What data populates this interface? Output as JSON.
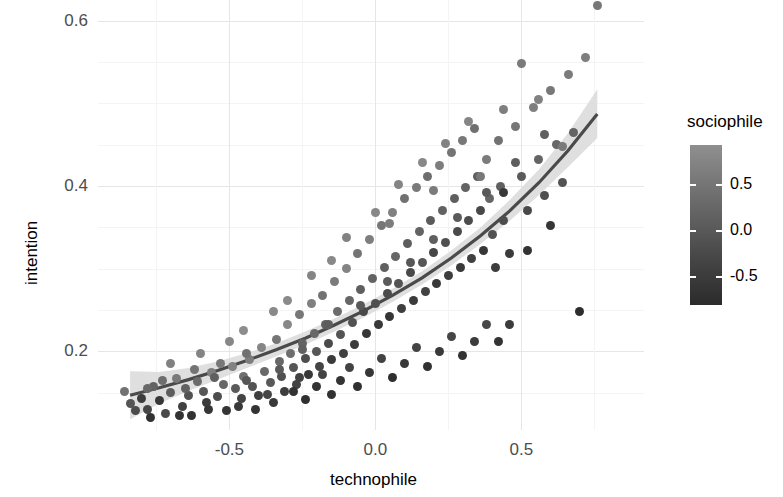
{
  "chart_data": {
    "type": "scatter",
    "title": "",
    "xlabel": "technophile",
    "ylabel": "intention",
    "xlim": [
      -0.95,
      0.92
    ],
    "ylim": [
      0.105,
      0.625
    ],
    "xticks": [
      "-0.5",
      "0.0",
      "0.5"
    ],
    "xtick_values": [
      -0.5,
      0.0,
      0.5
    ],
    "yticks": [
      "0.2",
      "0.4",
      "0.6"
    ],
    "ytick_values": [
      0.2,
      0.4,
      0.6
    ],
    "grid": true,
    "legend": {
      "title": "sociophile",
      "type": "colorbar",
      "position": "right",
      "ticks": [
        "0.5",
        "0.0",
        "-0.5"
      ],
      "tick_values": [
        0.5,
        0.0,
        -0.5
      ],
      "range": [
        -0.82,
        0.92
      ],
      "color_low": "#2b2b2b",
      "color_high": "#8f8f8f"
    },
    "fit": {
      "name": "smoothed trend",
      "line_color": "#4a4a4a",
      "ribbon_color": "#d9d9d9",
      "x": [
        -0.84,
        -0.74,
        -0.64,
        -0.54,
        -0.44,
        -0.34,
        -0.24,
        -0.14,
        -0.04,
        0.06,
        0.16,
        0.26,
        0.36,
        0.46,
        0.56,
        0.66,
        0.76
      ],
      "y": [
        0.147,
        0.156,
        0.166,
        0.177,
        0.189,
        0.202,
        0.216,
        0.232,
        0.249,
        0.268,
        0.289,
        0.313,
        0.34,
        0.37,
        0.404,
        0.443,
        0.487
      ],
      "ylo": [
        0.118,
        0.137,
        0.152,
        0.166,
        0.18,
        0.194,
        0.208,
        0.224,
        0.241,
        0.26,
        0.281,
        0.304,
        0.33,
        0.358,
        0.389,
        0.423,
        0.458
      ],
      "yhi": [
        0.176,
        0.175,
        0.18,
        0.188,
        0.198,
        0.21,
        0.224,
        0.24,
        0.257,
        0.276,
        0.297,
        0.322,
        0.35,
        0.383,
        0.42,
        0.464,
        0.517
      ]
    },
    "points": [
      [
        -0.86,
        0.152,
        0.42
      ],
      [
        -0.84,
        0.137,
        -0.1
      ],
      [
        -0.8,
        0.143,
        -0.52
      ],
      [
        -0.78,
        0.13,
        -0.35
      ],
      [
        -0.76,
        0.158,
        0.15
      ],
      [
        -0.74,
        0.141,
        -0.61
      ],
      [
        -0.72,
        0.125,
        -0.3
      ],
      [
        -0.7,
        0.15,
        0.05
      ],
      [
        -0.68,
        0.167,
        0.55
      ],
      [
        -0.66,
        0.133,
        -0.45
      ],
      [
        -0.64,
        0.147,
        -0.15
      ],
      [
        -0.63,
        0.122,
        -0.7
      ],
      [
        -0.61,
        0.164,
        0.3
      ],
      [
        -0.59,
        0.152,
        -0.05
      ],
      [
        -0.58,
        0.138,
        -0.55
      ],
      [
        -0.56,
        0.175,
        0.62
      ],
      [
        -0.54,
        0.145,
        -0.25
      ],
      [
        -0.52,
        0.16,
        0.2
      ],
      [
        -0.51,
        0.128,
        -0.65
      ],
      [
        -0.49,
        0.182,
        0.7
      ],
      [
        -0.48,
        0.155,
        0.0
      ],
      [
        -0.46,
        0.143,
        -0.4
      ],
      [
        -0.45,
        0.17,
        0.38
      ],
      [
        -0.43,
        0.19,
        0.6
      ],
      [
        -0.42,
        0.158,
        -0.12
      ],
      [
        -0.4,
        0.147,
        -0.48
      ],
      [
        -0.39,
        0.205,
        0.75
      ],
      [
        -0.38,
        0.176,
        0.28
      ],
      [
        -0.36,
        0.162,
        -0.02
      ],
      [
        -0.35,
        0.138,
        -0.58
      ],
      [
        -0.34,
        0.215,
        0.48
      ],
      [
        -0.33,
        0.188,
        0.22
      ],
      [
        -0.32,
        0.17,
        -0.18
      ],
      [
        -0.31,
        0.152,
        -0.5
      ],
      [
        -0.3,
        0.232,
        0.8
      ],
      [
        -0.29,
        0.198,
        0.35
      ],
      [
        -0.28,
        0.18,
        -0.08
      ],
      [
        -0.27,
        0.16,
        -0.42
      ],
      [
        -0.26,
        0.245,
        0.52
      ],
      [
        -0.25,
        0.21,
        0.18
      ],
      [
        -0.24,
        0.192,
        -0.22
      ],
      [
        -0.23,
        0.172,
        -0.6
      ],
      [
        -0.22,
        0.258,
        0.65
      ],
      [
        -0.21,
        0.222,
        0.25
      ],
      [
        -0.2,
        0.2,
        -0.05
      ],
      [
        -0.19,
        0.182,
        -0.38
      ],
      [
        -0.18,
        0.268,
        0.42
      ],
      [
        -0.17,
        0.232,
        0.12
      ],
      [
        -0.16,
        0.21,
        -0.28
      ],
      [
        -0.15,
        0.19,
        -0.55
      ],
      [
        -0.14,
        0.285,
        0.58
      ],
      [
        -0.13,
        0.248,
        0.3
      ],
      [
        -0.12,
        0.22,
        -0.1
      ],
      [
        -0.11,
        0.198,
        -0.45
      ],
      [
        -0.1,
        0.3,
        0.72
      ],
      [
        -0.09,
        0.262,
        0.2
      ],
      [
        -0.08,
        0.235,
        -0.15
      ],
      [
        -0.07,
        0.208,
        -0.52
      ],
      [
        -0.06,
        0.318,
        0.45
      ],
      [
        -0.05,
        0.275,
        0.08
      ],
      [
        -0.04,
        0.248,
        -0.32
      ],
      [
        -0.03,
        0.222,
        -0.62
      ],
      [
        -0.02,
        0.335,
        0.62
      ],
      [
        -0.01,
        0.288,
        0.15
      ],
      [
        0.0,
        0.258,
        -0.2
      ],
      [
        0.01,
        0.232,
        -0.58
      ],
      [
        0.02,
        0.352,
        0.5
      ],
      [
        0.03,
        0.302,
        0.1
      ],
      [
        0.04,
        0.27,
        -0.25
      ],
      [
        0.05,
        0.242,
        -0.65
      ],
      [
        0.06,
        0.368,
        0.68
      ],
      [
        0.07,
        0.315,
        0.22
      ],
      [
        0.08,
        0.282,
        -0.12
      ],
      [
        0.09,
        0.252,
        -0.48
      ],
      [
        0.1,
        0.385,
        0.4
      ],
      [
        0.11,
        0.33,
        0.05
      ],
      [
        0.12,
        0.295,
        -0.3
      ],
      [
        0.13,
        0.262,
        -0.55
      ],
      [
        0.14,
        0.398,
        0.55
      ],
      [
        0.15,
        0.345,
        0.18
      ],
      [
        0.16,
        0.308,
        -0.08
      ],
      [
        0.17,
        0.272,
        -0.42
      ],
      [
        0.18,
        0.412,
        0.35
      ],
      [
        0.19,
        0.358,
        0.02
      ],
      [
        0.2,
        0.32,
        -0.35
      ],
      [
        0.21,
        0.282,
        -0.6
      ],
      [
        0.22,
        0.425,
        0.6
      ],
      [
        0.23,
        0.37,
        0.12
      ],
      [
        0.24,
        0.332,
        -0.18
      ],
      [
        0.25,
        0.292,
        -0.5
      ],
      [
        0.26,
        0.44,
        0.45
      ],
      [
        0.27,
        0.385,
        0.08
      ],
      [
        0.28,
        0.345,
        -0.28
      ],
      [
        0.29,
        0.302,
        -0.58
      ],
      [
        0.3,
        0.455,
        0.52
      ],
      [
        0.31,
        0.398,
        0.15
      ],
      [
        0.32,
        0.358,
        -0.22
      ],
      [
        0.33,
        0.312,
        -0.45
      ],
      [
        0.34,
        0.47,
        0.38
      ],
      [
        0.35,
        0.412,
        0.05
      ],
      [
        0.36,
        0.37,
        -0.32
      ],
      [
        0.37,
        0.322,
        -0.62
      ],
      [
        0.38,
        0.432,
        0.58
      ],
      [
        0.39,
        0.385,
        0.2
      ],
      [
        0.4,
        0.342,
        -0.15
      ],
      [
        0.41,
        0.302,
        -0.52
      ],
      [
        0.42,
        0.455,
        0.42
      ],
      [
        0.43,
        0.4,
        0.1
      ],
      [
        0.44,
        0.358,
        -0.25
      ],
      [
        0.46,
        0.318,
        -0.55
      ],
      [
        0.48,
        0.472,
        0.48
      ],
      [
        0.5,
        0.412,
        0.0
      ],
      [
        0.52,
        0.37,
        -0.3
      ],
      [
        0.54,
        0.495,
        0.65
      ],
      [
        0.56,
        0.432,
        0.18
      ],
      [
        0.58,
        0.388,
        -0.2
      ],
      [
        0.6,
        0.515,
        0.52
      ],
      [
        0.62,
        0.45,
        0.22
      ],
      [
        0.64,
        0.404,
        -0.12
      ],
      [
        0.66,
        0.535,
        0.58
      ],
      [
        0.68,
        0.465,
        0.15
      ],
      [
        0.7,
        0.248,
        -0.78
      ],
      [
        0.72,
        0.555,
        0.62
      ],
      [
        0.76,
        0.618,
        0.5
      ],
      [
        -0.77,
        0.12,
        -0.72
      ],
      [
        -0.73,
        0.165,
        0.32
      ],
      [
        -0.67,
        0.122,
        -0.68
      ],
      [
        -0.62,
        0.178,
        0.45
      ],
      [
        -0.57,
        0.13,
        -0.62
      ],
      [
        -0.53,
        0.186,
        0.52
      ],
      [
        -0.47,
        0.133,
        -0.58
      ],
      [
        -0.44,
        0.198,
        0.4
      ],
      [
        -0.41,
        0.13,
        -0.66
      ],
      [
        -0.37,
        0.148,
        -0.36
      ],
      [
        -0.28,
        0.152,
        -0.7
      ],
      [
        -0.26,
        0.168,
        -0.44
      ],
      [
        -0.24,
        0.142,
        -0.75
      ],
      [
        -0.2,
        0.158,
        -0.68
      ],
      [
        -0.18,
        0.172,
        -0.38
      ],
      [
        -0.15,
        0.148,
        -0.72
      ],
      [
        -0.12,
        0.165,
        -0.66
      ],
      [
        -0.09,
        0.18,
        -0.4
      ],
      [
        -0.06,
        0.158,
        -0.74
      ],
      [
        -0.02,
        0.175,
        -0.62
      ],
      [
        0.02,
        0.192,
        -0.42
      ],
      [
        0.06,
        0.168,
        -0.76
      ],
      [
        0.1,
        0.185,
        -0.6
      ],
      [
        0.14,
        0.205,
        -0.38
      ],
      [
        0.18,
        0.182,
        -0.72
      ],
      [
        0.22,
        0.2,
        -0.58
      ],
      [
        0.26,
        0.218,
        -0.35
      ],
      [
        0.3,
        0.195,
        -0.7
      ],
      [
        0.34,
        0.212,
        -0.55
      ],
      [
        0.38,
        0.232,
        -0.32
      ],
      [
        0.42,
        0.212,
        -0.68
      ],
      [
        0.46,
        0.232,
        -0.52
      ],
      [
        -0.7,
        0.185,
        0.68
      ],
      [
        -0.6,
        0.198,
        0.72
      ],
      [
        -0.5,
        0.212,
        0.78
      ],
      [
        -0.35,
        0.248,
        0.82
      ],
      [
        -0.22,
        0.292,
        0.75
      ],
      [
        -0.1,
        0.338,
        0.7
      ],
      [
        0.0,
        0.368,
        0.78
      ],
      [
        0.08,
        0.402,
        0.72
      ],
      [
        0.16,
        0.428,
        0.8
      ],
      [
        0.24,
        0.452,
        0.68
      ],
      [
        0.32,
        0.478,
        0.75
      ],
      [
        0.44,
        0.492,
        0.62
      ],
      [
        0.56,
        0.505,
        0.7
      ],
      [
        0.64,
        0.448,
        0.55
      ],
      [
        -0.45,
        0.225,
        0.88
      ],
      [
        -0.3,
        0.262,
        0.85
      ],
      [
        -0.15,
        0.31,
        0.8
      ],
      [
        0.05,
        0.355,
        0.6
      ],
      [
        0.2,
        0.395,
        0.58
      ],
      [
        0.36,
        0.412,
        0.52
      ],
      [
        -0.82,
        0.128,
        -0.25
      ],
      [
        -0.78,
        0.155,
        0.25
      ],
      [
        -0.65,
        0.155,
        0.12
      ],
      [
        -0.55,
        0.168,
        0.08
      ],
      [
        -0.44,
        0.165,
        -0.05
      ],
      [
        -0.33,
        0.178,
        -0.02
      ],
      [
        -0.25,
        0.202,
        0.1
      ],
      [
        -0.16,
        0.232,
        0.05
      ],
      [
        -0.05,
        0.255,
        -0.02
      ],
      [
        0.04,
        0.285,
        0.02
      ],
      [
        0.12,
        0.308,
        -0.05
      ],
      [
        0.2,
        0.335,
        0.08
      ],
      [
        0.28,
        0.362,
        0.02
      ],
      [
        0.38,
        0.392,
        -0.02
      ],
      [
        0.48,
        0.428,
        0.05
      ],
      [
        0.58,
        0.462,
        0.1
      ],
      [
        0.5,
        0.548,
        0.55
      ],
      [
        0.44,
        0.392,
        -0.58
      ],
      [
        0.52,
        0.322,
        -0.68
      ],
      [
        0.6,
        0.352,
        -0.62
      ]
    ]
  }
}
